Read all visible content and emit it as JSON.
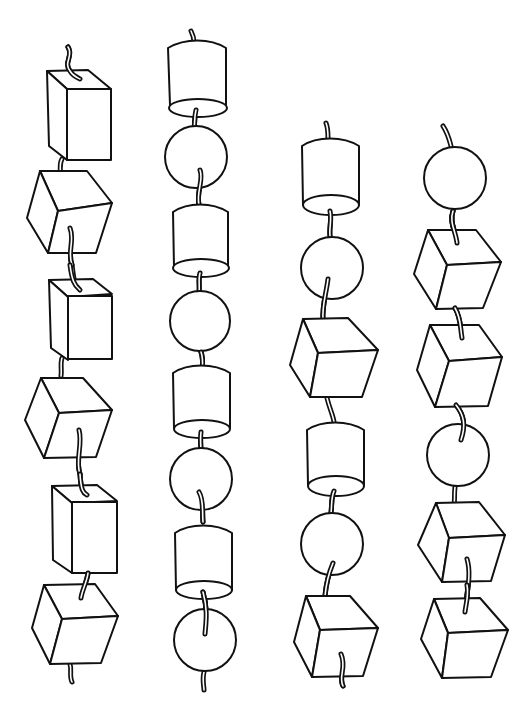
{
  "figure": {
    "colors": {
      "stroke": "#111111",
      "background": "#ffffff"
    },
    "strings": [
      {
        "id": "string-1",
        "beads": [
          "tall-box",
          "cube",
          "tall-box",
          "cube",
          "tall-box",
          "cube"
        ]
      },
      {
        "id": "string-2",
        "beads": [
          "cylinder",
          "sphere",
          "cylinder",
          "sphere",
          "cylinder",
          "sphere",
          "cylinder",
          "sphere"
        ]
      },
      {
        "id": "string-3",
        "beads": [
          "cylinder",
          "sphere",
          "cube",
          "cylinder",
          "sphere",
          "cube"
        ]
      },
      {
        "id": "string-4",
        "beads": [
          "sphere",
          "cube",
          "cube",
          "sphere",
          "cube",
          "cube"
        ]
      }
    ]
  }
}
